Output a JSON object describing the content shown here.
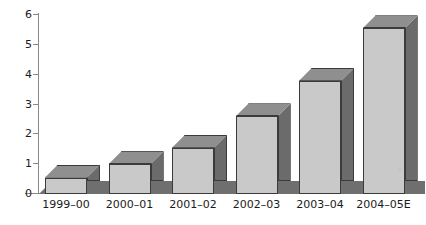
{
  "chart_data": {
    "type": "bar",
    "title": "",
    "subtitle": "",
    "xlabel": "",
    "ylabel": "",
    "categories": [
      "1999–00",
      "2000–01",
      "2001–02",
      "2002–03",
      "2003–04",
      "2004–05E"
    ],
    "values": [
      0.55,
      1.0,
      1.55,
      2.6,
      3.8,
      5.55
    ],
    "series": [
      {
        "name": "",
        "values": [
          0.55,
          1.0,
          1.55,
          2.6,
          3.8,
          5.55
        ]
      }
    ],
    "ylim": [
      0,
      6
    ],
    "y_ticks": [
      0,
      1,
      2,
      3,
      4,
      5,
      6
    ],
    "y_tick_labels": [
      "0",
      "1",
      "2",
      "3",
      "4",
      "5",
      "6"
    ],
    "grid": false,
    "legend": null,
    "legend_position": "none",
    "style": "3d-column",
    "annotations": []
  },
  "colors": {
    "bar_front": "#c9c9c9",
    "bar_side": "#6b6b6b",
    "bar_top": "#8f8f8f",
    "bar_outline": "#3b3b3b",
    "floor": "#6f6f6f",
    "axis": "#8a8a8a",
    "text": "#1b1b1b",
    "background": "#ffffff"
  }
}
